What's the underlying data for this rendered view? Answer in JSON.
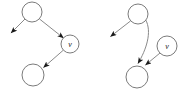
{
  "figure": {
    "background_color": "#ffffff",
    "width": 190,
    "height": 94,
    "node_stroke_color": "#7b7b7b",
    "edge_stroke_color": "#8a8a8a",
    "arrow_fill_color": "#1a1a1a",
    "label_color": "#1a1a1a"
  },
  "diagrams": [
    {
      "id": "left-diagram",
      "name": "left-graph",
      "nodes": [
        {
          "id": "L1",
          "name": "top-node",
          "label": "",
          "cx": 32,
          "cy": 12,
          "r": 10
        },
        {
          "id": "L2",
          "name": "v-node",
          "label": "v",
          "cx": 70,
          "cy": 44,
          "r": 9
        },
        {
          "id": "L3",
          "name": "bottom-node",
          "label": "",
          "cx": 33,
          "cy": 75,
          "r": 11
        }
      ],
      "edges": [
        {
          "name": "edge-top-to-dangling",
          "from": "L1",
          "to": "dangling-left",
          "type": "straight",
          "arrow": true
        },
        {
          "name": "edge-top-to-v",
          "from": "L1",
          "to": "L2",
          "type": "straight",
          "arrow": true
        },
        {
          "name": "edge-v-to-bottom",
          "from": "L2",
          "to": "L3",
          "type": "straight",
          "arrow": true
        }
      ]
    },
    {
      "id": "right-diagram",
      "name": "right-graph",
      "nodes": [
        {
          "id": "R1",
          "name": "top-node",
          "label": "",
          "cx": 138,
          "cy": 14,
          "r": 10
        },
        {
          "id": "R2",
          "name": "v-node",
          "label": "v",
          "cx": 167,
          "cy": 46,
          "r": 10
        },
        {
          "id": "R3",
          "name": "bottom-node",
          "label": "",
          "cx": 137,
          "cy": 77,
          "r": 11
        }
      ],
      "edges": [
        {
          "name": "edge-top-to-dangling",
          "from": "R1",
          "to": "dangling-left",
          "type": "straight",
          "arrow": true
        },
        {
          "name": "edge-top-to-bottom",
          "from": "R1",
          "to": "R3",
          "type": "curved",
          "arrow": true
        },
        {
          "name": "edge-v-to-bottom",
          "from": "R2",
          "to": "R3",
          "type": "straight",
          "arrow": true
        }
      ]
    }
  ],
  "labels": {
    "left_v": "v",
    "right_v": "v"
  }
}
